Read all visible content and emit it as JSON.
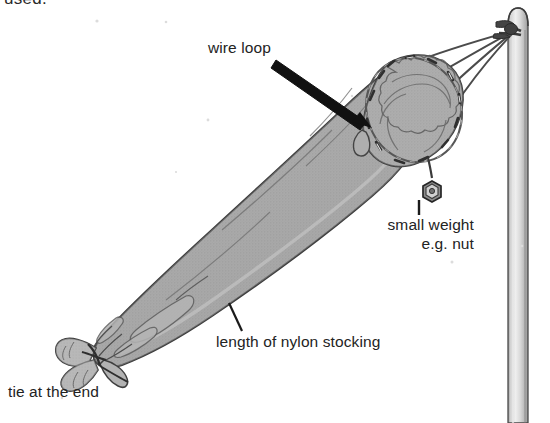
{
  "figure": {
    "type": "line-drawing-diagram",
    "clipped_top_text": "used.",
    "colors": {
      "ink": "#2b2b2b",
      "fabric_fill": "#a8a8a8",
      "fabric_fill_light": "#b9b9b9",
      "pole_fill": "#c9c9c9",
      "background": "#ffffff",
      "arrow": "#111111"
    }
  },
  "labels": {
    "wire_loop": "wire loop",
    "small_weight_line1": "small weight",
    "small_weight_line2": "e.g. nut",
    "nylon_stocking": "length of nylon stocking",
    "tie_at_end": "tie at the end"
  },
  "parts": {
    "bag": "nylon stocking body",
    "wire_loop_ring": "wire loop sewn into mouth",
    "nut": "small hexagonal nut weight",
    "strings": "four bridle strings",
    "pole": "vertical support pole",
    "knot": "knot tying strings to pole",
    "tail_tie": "tied gathered end of stocking"
  },
  "counts": {
    "bridle_strings": 4,
    "label_leaders": 3
  }
}
